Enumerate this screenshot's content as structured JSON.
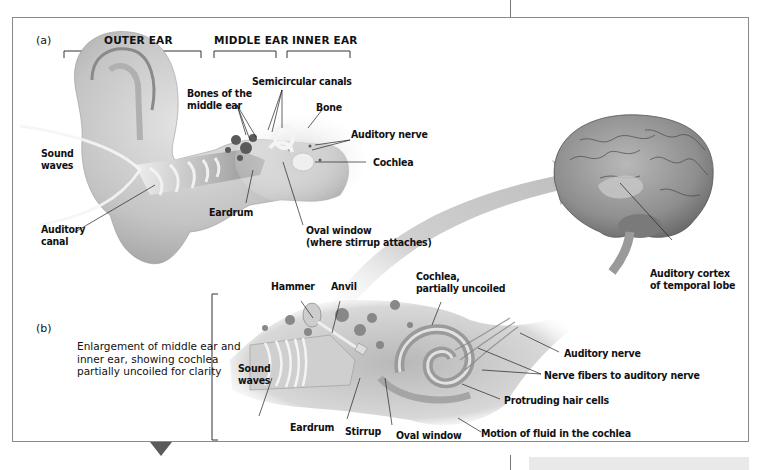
{
  "figure": {
    "panel_a": {
      "tag": "(a)",
      "regions": {
        "outer_ear": "OUTER EAR",
        "middle_ear": "MIDDLE EAR",
        "inner_ear": "INNER EAR"
      },
      "labels": {
        "sound_waves_1": "Sound",
        "sound_waves_2": "waves",
        "auditory_canal_1": "Auditory",
        "auditory_canal_2": "canal",
        "bones_1": "Bones of the",
        "bones_2": "middle ear",
        "semicircular": "Semicircular canals",
        "bone": "Bone",
        "auditory_nerve": "Auditory nerve",
        "cochlea": "Cochlea",
        "eardrum": "Eardrum",
        "oval_window_1": "Oval window",
        "oval_window_2": "(where stirrup attaches)"
      }
    },
    "brain": {
      "labels": {
        "cortex_1": "Auditory cortex",
        "cortex_2": "of temporal lobe"
      }
    },
    "panel_b": {
      "tag": "(b)",
      "caption": "Enlargement of middle ear and inner ear, showing cochlea partially uncoiled for clarity",
      "labels": {
        "hammer": "Hammer",
        "anvil": "Anvil",
        "cochlea_1": "Cochlea,",
        "cochlea_2": "partially uncoiled",
        "sound_waves_1": "Sound",
        "sound_waves_2": "waves",
        "eardrum": "Eardrum",
        "stirrup": "Stirrup",
        "oval_window": "Oval window",
        "auditory_nerve": "Auditory nerve",
        "nerve_fibers": "Nerve fibers to auditory nerve",
        "hair_cells": "Protruding hair cells",
        "fluid_motion": "Motion of fluid in the cochlea"
      }
    },
    "colors": {
      "frame_border": "#8a8a8a",
      "tissue_light": "#d4d4d4",
      "tissue_mid": "#a8a8a8",
      "tissue_dark": "#5e5e5e",
      "arrow": "#b9b9b9",
      "triangle": "#5a5a5a"
    }
  }
}
